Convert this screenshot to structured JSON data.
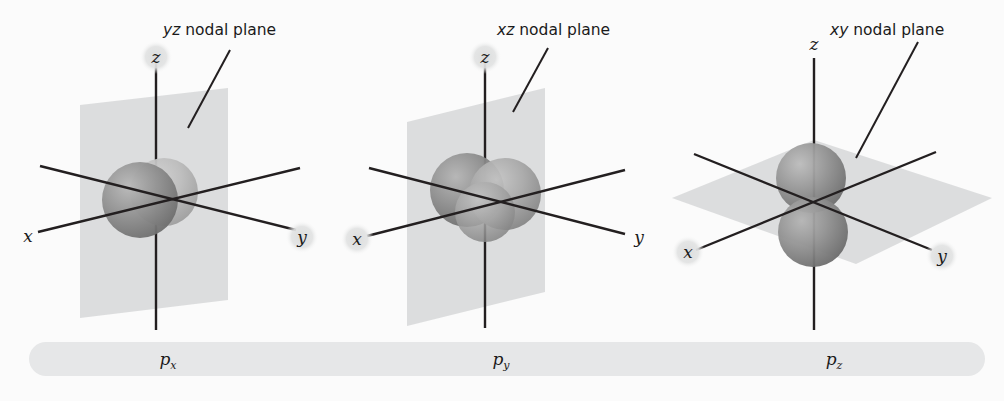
{
  "figure": {
    "background_color": "#fbfbfb",
    "plane_color": "#d9dadb",
    "axis_color": "#231f20",
    "caption_bar_color": "#e6e7e8",
    "halo_color": "#e3e4e5",
    "lobe_dark_color": "#8a8a8a",
    "lobe_light_color": "#b4b4b4"
  },
  "panels": [
    {
      "id": "px",
      "orbital_name": "p",
      "orbital_subscript": "x",
      "caption": "px",
      "nodal_plane": {
        "prefix": "yz",
        "suffix": " nodal plane",
        "orientation": "vertical-yz"
      },
      "axes": [
        {
          "name": "x",
          "label": "x",
          "halo": false
        },
        {
          "name": "y",
          "label": "y",
          "halo": true
        },
        {
          "name": "z",
          "label": "z",
          "halo": true
        }
      ],
      "lobe_axis": "x"
    },
    {
      "id": "py",
      "orbital_name": "p",
      "orbital_subscript": "y",
      "caption": "py",
      "nodal_plane": {
        "prefix": "xz",
        "suffix": " nodal plane",
        "orientation": "vertical-xz"
      },
      "axes": [
        {
          "name": "x",
          "label": "x",
          "halo": true
        },
        {
          "name": "y",
          "label": "y",
          "halo": false
        },
        {
          "name": "z",
          "label": "z",
          "halo": true
        }
      ],
      "lobe_axis": "y"
    },
    {
      "id": "pz",
      "orbital_name": "p",
      "orbital_subscript": "z",
      "caption": "pz",
      "nodal_plane": {
        "prefix": "xy",
        "suffix": " nodal plane",
        "orientation": "horizontal-xy"
      },
      "axes": [
        {
          "name": "x",
          "label": "x",
          "halo": true
        },
        {
          "name": "y",
          "label": "y",
          "halo": true
        },
        {
          "name": "z",
          "label": "z",
          "halo": false
        }
      ],
      "lobe_axis": "z"
    }
  ],
  "captions": {
    "px_p": "p",
    "px_sub": "x",
    "py_p": "p",
    "py_sub": "y",
    "pz_p": "p",
    "pz_sub": "z"
  },
  "labels": {
    "yz_prefix": "yz",
    "yz_suffix": " nodal plane",
    "xz_prefix": "xz",
    "xz_suffix": " nodal plane",
    "xy_prefix": "xy",
    "xy_suffix": " nodal plane",
    "axis_x": "x",
    "axis_y": "y",
    "axis_z": "z"
  }
}
